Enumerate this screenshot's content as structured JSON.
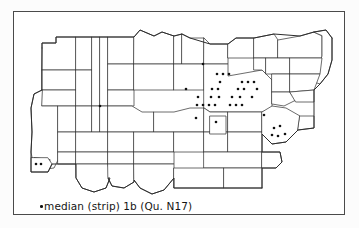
{
  "figure": {
    "type": "dot-distribution-map",
    "caption_symbol": "legend-dot",
    "caption_text": "median (strip) 1b  (Qu. N17)",
    "caption_full": "•median (strip) 1b  (Qu. N17)",
    "variant_label": "median (strip)",
    "variant_number": "1b",
    "question_reference": "(Qu. N17)",
    "question_code": "N17"
  },
  "colors": {
    "frame": "#4a4a4a",
    "region_stroke": "#3b3b3b",
    "outline_stroke": "#2c2c2c",
    "dot": "#111111",
    "paper": "#ffffff",
    "page_background": "#fcfcfc",
    "caption_text": "#151515"
  },
  "chart_data": {
    "type": "scatter",
    "title": "median (strip) 1b  (Qu. N17)",
    "xlabel": "",
    "ylabel": "",
    "grid": false,
    "legend": "bottom-left",
    "legend_entries": [
      {
        "symbol": "dot",
        "label": "median (strip) 1b  (Qu. N17)"
      }
    ],
    "xlim": [
      0,
      332
    ],
    "ylim": [
      0,
      204
    ],
    "point_count": 38,
    "points": [
      {
        "x": 22,
        "y": 152
      },
      {
        "x": 27,
        "y": 152
      },
      {
        "x": 86,
        "y": 94
      },
      {
        "x": 189,
        "y": 52
      },
      {
        "x": 203,
        "y": 62
      },
      {
        "x": 209,
        "y": 62
      },
      {
        "x": 215,
        "y": 62
      },
      {
        "x": 206,
        "y": 70
      },
      {
        "x": 228,
        "y": 70
      },
      {
        "x": 234,
        "y": 70
      },
      {
        "x": 240,
        "y": 70
      },
      {
        "x": 172,
        "y": 77
      },
      {
        "x": 198,
        "y": 77
      },
      {
        "x": 204,
        "y": 77
      },
      {
        "x": 224,
        "y": 77
      },
      {
        "x": 230,
        "y": 77
      },
      {
        "x": 243,
        "y": 77
      },
      {
        "x": 184,
        "y": 85
      },
      {
        "x": 197,
        "y": 85
      },
      {
        "x": 205,
        "y": 85
      },
      {
        "x": 218,
        "y": 85
      },
      {
        "x": 226,
        "y": 85
      },
      {
        "x": 238,
        "y": 85
      },
      {
        "x": 183,
        "y": 93
      },
      {
        "x": 189,
        "y": 93
      },
      {
        "x": 195,
        "y": 93
      },
      {
        "x": 201,
        "y": 93
      },
      {
        "x": 216,
        "y": 93
      },
      {
        "x": 222,
        "y": 93
      },
      {
        "x": 228,
        "y": 93
      },
      {
        "x": 182,
        "y": 106
      },
      {
        "x": 202,
        "y": 110
      },
      {
        "x": 250,
        "y": 103
      },
      {
        "x": 260,
        "y": 116
      },
      {
        "x": 266,
        "y": 114
      },
      {
        "x": 258,
        "y": 123
      },
      {
        "x": 264,
        "y": 124
      },
      {
        "x": 271,
        "y": 122
      }
    ]
  },
  "map": {
    "description": "Administrative survey map divided into districts with survey-point dots",
    "frame": {
      "left": 13,
      "top": 11,
      "width": 332,
      "height": 204
    }
  }
}
